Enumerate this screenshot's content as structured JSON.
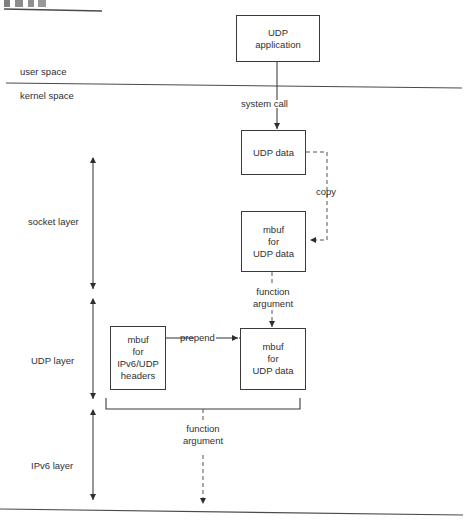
{
  "figure": {
    "title_fragment": "",
    "boundary_labels": {
      "user_space": "user space",
      "kernel_space": "kernel space"
    },
    "layers": [
      {
        "name": "socket layer"
      },
      {
        "name": "UDP layer"
      },
      {
        "name": "IPv6 layer"
      }
    ],
    "boxes": [
      {
        "id": "udp-application",
        "lines": [
          "UDP",
          "application"
        ]
      },
      {
        "id": "udp-data",
        "lines": [
          "UDP data"
        ]
      },
      {
        "id": "mbuf-udp-data-socket",
        "lines": [
          "mbuf",
          "for",
          "UDP data"
        ]
      },
      {
        "id": "mbuf-ipv6-udp-headers",
        "lines": [
          "mbuf",
          "for",
          "IPv6/UDP",
          "headers"
        ]
      },
      {
        "id": "mbuf-udp-data-udp",
        "lines": [
          "mbuf",
          "for",
          "UDP data"
        ]
      }
    ],
    "edge_labels": {
      "system_call": "system call",
      "copy": "copy",
      "function_argument_1_line1": "function",
      "function_argument_1_line2": "argument",
      "prepend": "prepend",
      "function_argument_2_line1": "function",
      "function_argument_2_line2": "argument"
    },
    "colors": {
      "ink": "#303030",
      "stroke": "#3a3a3a",
      "rule": "#4a4a4a",
      "page": "#ffffff"
    }
  }
}
